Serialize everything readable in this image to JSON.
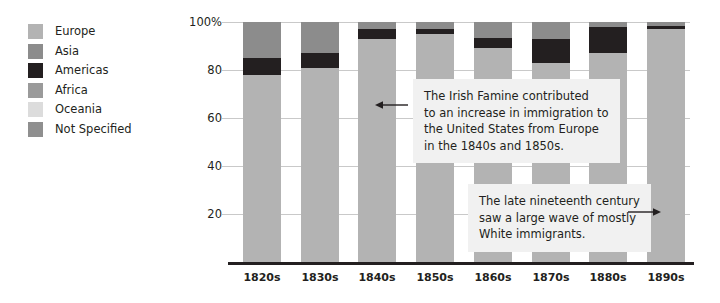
{
  "chart_data": {
    "type": "bar",
    "stacked": true,
    "stack_mode": "percent",
    "title": "",
    "subtitle": "",
    "xlabel": "",
    "ylabel": "",
    "ylim": [
      0,
      100
    ],
    "grid": true,
    "legend_position": "left",
    "categories": [
      "1820s",
      "1830s",
      "1840s",
      "1850s",
      "1860s",
      "1870s",
      "1880s",
      "1890s"
    ],
    "ytick_labels": [
      "100%",
      "80",
      "60",
      "40",
      "20"
    ],
    "ytick_values": [
      100,
      80,
      60,
      40,
      20
    ],
    "series": [
      {
        "name": "Europe",
        "color": "#b3b3b3",
        "values": [
          78,
          81,
          93,
          95,
          89,
          83,
          87,
          97
        ]
      },
      {
        "name": "Americas",
        "color": "#231f20",
        "values": [
          7,
          6,
          4,
          2,
          4.5,
          10,
          11,
          1.5
        ]
      },
      {
        "name": "Asia",
        "color": "#8c8c8c",
        "values": [
          15,
          13,
          3,
          3,
          6.5,
          7,
          2,
          1.5
        ]
      },
      {
        "name": "Africa",
        "color": "#9a9a9a",
        "values": [
          0,
          0,
          0,
          0,
          0,
          0,
          0,
          0
        ]
      },
      {
        "name": "Oceania",
        "color": "#dcdcdc",
        "values": [
          0,
          0,
          0,
          0,
          0,
          0,
          0,
          0
        ]
      },
      {
        "name": "Not Specified",
        "color": "#8f8f8f",
        "values": [
          0,
          0,
          0,
          0,
          0,
          0,
          0,
          0
        ]
      }
    ],
    "annotations": [
      {
        "id": "irish-famine",
        "lines": [
          "The Irish Famine contributed",
          "to an increase in immigration to",
          "the United States from Europe",
          "in the 1840s and 1850s."
        ],
        "arrow_direction": "left"
      },
      {
        "id": "late-nineteenth-century",
        "lines": [
          "The late nineteenth century",
          "saw a large wave of mostly",
          "White immigrants."
        ],
        "arrow_direction": "right"
      }
    ]
  },
  "legend": {
    "items": [
      {
        "label": "Europe",
        "color": "#b3b3b3"
      },
      {
        "label": "Asia",
        "color": "#8c8c8c"
      },
      {
        "label": "Americas",
        "color": "#231f20"
      },
      {
        "label": "Africa",
        "color": "#9a9a9a"
      },
      {
        "label": "Oceania",
        "color": "#dcdcdc"
      },
      {
        "label": "Not Specified",
        "color": "#8f8f8f"
      }
    ]
  },
  "colors": {
    "background": "#ffffff",
    "text": "#231f20",
    "gridline": "#c9c9c9",
    "axis": "#231f20",
    "annotation_background": "#f1f1f1"
  }
}
